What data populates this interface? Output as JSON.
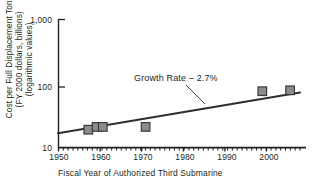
{
  "chart_data": {
    "type": "scatter",
    "title": "",
    "xlabel": "Fiscal Year of Authorized Third Submarine",
    "ylabel_lines": [
      "Cost per Full Displacement Ton",
      "(FY 2000 dollars, billions)",
      "(logarithmic values)"
    ],
    "yscale": "log",
    "ylim": [
      10,
      1000
    ],
    "ytick_labels": [
      "1,000",
      "100",
      "10"
    ],
    "ytick_values": [
      1000,
      100,
      10
    ],
    "xlim": [
      1950,
      2000
    ],
    "xtick_labels": [
      "1950",
      "1960",
      "1970",
      "1980",
      "1990",
      "2000"
    ],
    "xtick_values": [
      1950,
      1960,
      1970,
      1980,
      1990,
      2000
    ],
    "minor_xticks": "every year 1950-2000",
    "grid": false,
    "legend": false,
    "annotations": [
      {
        "text": "Growth Rate – 2.7%",
        "x": 1971,
        "y": 160,
        "leader_to_x": 1981,
        "leader_to_y": 52
      }
    ],
    "series": [
      {
        "name": "Submarine cost per full displacement ton",
        "marker": "square",
        "marker_color": "#8c8c8c",
        "marker_edge_color": "#3a3a3a",
        "points": [
          {
            "x": 1956,
            "y": 21
          },
          {
            "x": 1958,
            "y": 23
          },
          {
            "x": 1959,
            "y": 23
          },
          {
            "x": 1970,
            "y": 23
          },
          {
            "x": 1994,
            "y": 76
          },
          {
            "x": 1999,
            "y": 78
          }
        ]
      }
    ],
    "trendline": {
      "name": "Growth Rate – 2.7%",
      "color": "#2e2e2e",
      "x_start": 1950,
      "y_start": 16,
      "x_end": 2000,
      "y_end": 82
    }
  },
  "axes": {
    "y_ticks": [
      {
        "label": "1,000"
      },
      {
        "label": "100"
      },
      {
        "label": "10"
      }
    ],
    "x_ticks": [
      {
        "label": "1950"
      },
      {
        "label": "1960"
      },
      {
        "label": "1970"
      },
      {
        "label": "1980"
      },
      {
        "label": "1990"
      },
      {
        "label": "2000"
      }
    ],
    "x_caption": "Fiscal Year of Authorized Third Submarine",
    "y_caption_line1": "Cost per Full Displacement Ton",
    "y_caption_line2": "(FY 2000 dollars, billions)",
    "y_caption_line3": "(logarithmic values)"
  },
  "annotation": {
    "growth_rate": "Growth Rate – 2.7%"
  },
  "colors": {
    "axis": "#231f20",
    "trendline": "#2e2e2e",
    "marker_fill": "#8c8c8c",
    "marker_edge": "#3a3a3a",
    "background": "#ffffff"
  }
}
